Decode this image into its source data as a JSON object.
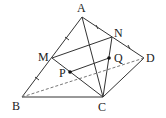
{
  "diagram": {
    "type": "tetrahedron",
    "stroke_color": "#333333",
    "points": {
      "A": {
        "label": "A",
        "x": 82,
        "y": 17
      },
      "B": {
        "label": "B",
        "x": 22,
        "y": 97
      },
      "C": {
        "label": "C",
        "x": 103,
        "y": 97
      },
      "D": {
        "label": "D",
        "x": 144,
        "y": 58
      },
      "M": {
        "label": "M",
        "x": 52,
        "y": 58
      },
      "N": {
        "label": "N",
        "x": 112,
        "y": 37
      },
      "P": {
        "label": "P",
        "x": 70,
        "y": 72
      },
      "Q": {
        "label": "Q",
        "x": 109,
        "y": 58
      }
    },
    "solid_segments": [
      "AB",
      "AC",
      "AD",
      "BC",
      "CD",
      "MN",
      "MC",
      "NC",
      "PQ"
    ],
    "dashed_segments": [
      "BD"
    ],
    "dots": [
      "P",
      "Q"
    ],
    "tick_marks": [
      "AM",
      "MB",
      "AN",
      "ND"
    ]
  }
}
